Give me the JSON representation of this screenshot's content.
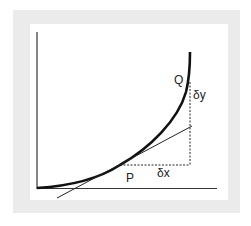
{
  "diagram": {
    "labels": {
      "point_p": "P",
      "point_q": "Q",
      "delta_x": "δx",
      "delta_y": "δy"
    },
    "colors": {
      "frame": "#ebebeb",
      "ink": "#111111"
    }
  }
}
